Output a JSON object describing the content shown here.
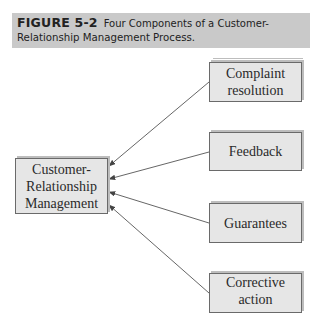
{
  "figure": {
    "number": "FIGURE 5-2",
    "title_line1": "Four Components of a Customer-",
    "title_line2": "Relationship Management Process."
  },
  "diagram": {
    "center_node": {
      "line1": "Customer-",
      "line2": "Relationship",
      "line3": "Management"
    },
    "components": [
      {
        "line1": "Complaint",
        "line2": "resolution"
      },
      {
        "line1": "Feedback",
        "line2": ""
      },
      {
        "line1": "Guarantees",
        "line2": ""
      },
      {
        "line1": "Corrective",
        "line2": "action"
      }
    ],
    "edges": [
      {
        "from": "Complaint resolution",
        "to": "Customer-Relationship Management"
      },
      {
        "from": "Feedback",
        "to": "Customer-Relationship Management"
      },
      {
        "from": "Guarantees",
        "to": "Customer-Relationship Management"
      },
      {
        "from": "Corrective action",
        "to": "Customer-Relationship Management"
      }
    ],
    "colors": {
      "caption_bg": "#c9c9c9",
      "box_fill": "#e6e6e6",
      "box_border": "#6a6a6a",
      "arrow": "#555555"
    }
  }
}
